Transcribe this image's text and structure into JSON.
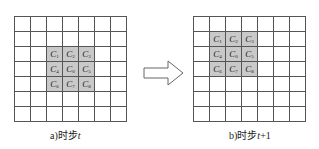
{
  "diagram": {
    "grid_size": 7,
    "panels": [
      {
        "id": "a",
        "caption_prefix": "a)时步",
        "caption_var": "t",
        "caption_suffix": "",
        "shaded_origin": {
          "row": 2,
          "col": 2
        },
        "labels": [
          [
            "C",
            "1"
          ],
          [
            "C",
            "2"
          ],
          [
            "C",
            "3"
          ],
          [
            "C",
            "4"
          ],
          [
            "C",
            "0"
          ],
          [
            "C",
            "5"
          ],
          [
            "C",
            "6"
          ],
          [
            "C",
            "7"
          ],
          [
            "C",
            "8"
          ]
        ]
      },
      {
        "id": "b",
        "caption_prefix": "b)时步",
        "caption_var": "t",
        "caption_suffix": "+1",
        "shaded_origin": {
          "row": 1,
          "col": 1
        },
        "labels": [
          [
            "C",
            "1"
          ],
          [
            "C",
            "2"
          ],
          [
            "C",
            "3"
          ],
          [
            "C",
            "4"
          ],
          [
            "C",
            "0"
          ],
          [
            "C",
            "5"
          ],
          [
            "C",
            "6"
          ],
          [
            "C",
            "7"
          ],
          [
            "C",
            "8"
          ]
        ]
      }
    ],
    "arrow": {
      "direction": "right",
      "style": "hollow"
    },
    "colors": {
      "grid_line": "#555555",
      "shaded_cell": "#c9c9c9",
      "background": "#ffffff"
    }
  }
}
